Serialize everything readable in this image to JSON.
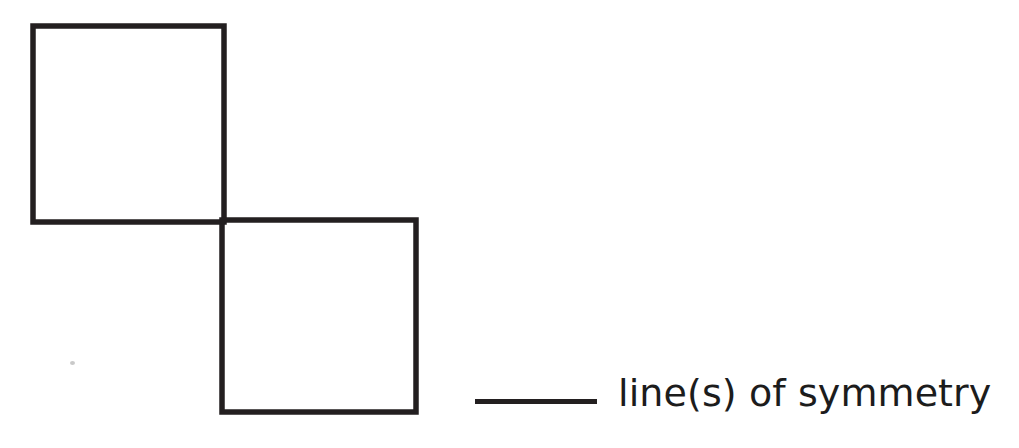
{
  "page": {
    "background_color": "#ffffff",
    "width": 1019,
    "height": 448,
    "kind": "math-worksheet-question"
  },
  "figure": {
    "name": "two-squares-diagonal",
    "stroke_color": "#231f20",
    "stroke_width": 5.5,
    "fill": "none",
    "squares": [
      {
        "id": "upper-left-square",
        "x": 33,
        "y": 26,
        "width": 191,
        "height": 196
      },
      {
        "id": "lower-right-square",
        "x": 222,
        "y": 220,
        "width": 194,
        "height": 192
      }
    ],
    "shared_corner": {
      "x": 223,
      "y": 221
    }
  },
  "artifact": {
    "name": "scan-speck",
    "color": "#c9c9c9",
    "x": 70,
    "y": 361
  },
  "answer": {
    "blank_value": "",
    "blank_color": "#231f20",
    "blank_width": 122,
    "label": "line(s) of symmetry",
    "text_color": "#1c1c1c",
    "font_size": 38
  }
}
